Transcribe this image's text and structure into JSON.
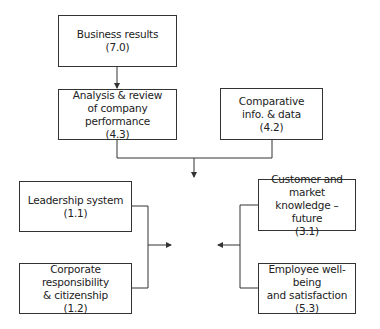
{
  "diagram": {
    "nodes": [
      {
        "id": "business-results",
        "lines": [
          "Business results",
          "(7.0)"
        ]
      },
      {
        "id": "analysis-review",
        "lines": [
          "Analysis & review",
          "of company performance",
          "(4.3)"
        ]
      },
      {
        "id": "comparative-info",
        "lines": [
          "Comparative",
          "info. & data",
          "(4.2)"
        ]
      },
      {
        "id": "leadership-system",
        "lines": [
          "Leadership system",
          "(1.1)"
        ]
      },
      {
        "id": "corporate-responsibility",
        "lines": [
          "Corporate responsibility",
          "& citizenship",
          "(1.2)"
        ]
      },
      {
        "id": "customer-market",
        "lines": [
          "Customer and market",
          "knowledge – future",
          "(3.1)"
        ]
      },
      {
        "id": "employee-wellbeing",
        "lines": [
          "Employee well-being",
          "and satisfaction",
          "(5.3)"
        ]
      }
    ],
    "edges": [
      {
        "from": "business-results",
        "to": "analysis-review"
      },
      {
        "from": "analysis-review",
        "to": "center"
      },
      {
        "from": "comparative-info",
        "to": "center"
      },
      {
        "from": "leadership-system",
        "to": "center"
      },
      {
        "from": "corporate-responsibility",
        "to": "center"
      },
      {
        "from": "customer-market",
        "to": "center"
      },
      {
        "from": "employee-wellbeing",
        "to": "center"
      }
    ]
  }
}
